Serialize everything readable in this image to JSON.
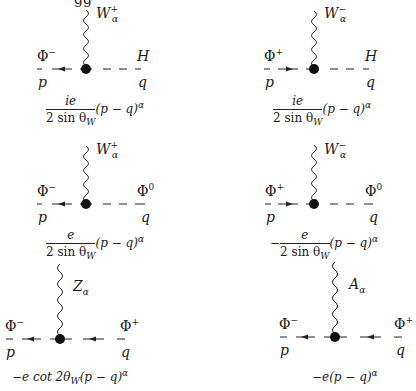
{
  "page": {
    "top_partial_text": "gg"
  },
  "diagrams": [
    {
      "boson": "W",
      "boson_sub": "α",
      "boson_sup": "+",
      "left_field": "Φ",
      "left_sup": "−",
      "left_momentum": "p",
      "right_field": "H",
      "right_sup": "",
      "right_momentum": "q",
      "left_arrow": "left",
      "right_line": "dashed",
      "rule_prefix": "",
      "rule_num": "ie",
      "rule_den": "2 sin θ",
      "rule_den_sub": "W",
      "rule_suffix": "(p − q)",
      "rule_suffix_sup": "α"
    },
    {
      "boson": "W",
      "boson_sub": "α",
      "boson_sup": "−",
      "left_field": "Φ",
      "left_sup": "+",
      "left_momentum": "p",
      "right_field": "H",
      "right_sup": "",
      "right_momentum": "q",
      "left_arrow": "right",
      "right_line": "dashed",
      "rule_prefix": "",
      "rule_num": "ie",
      "rule_den": "2 sin θ",
      "rule_den_sub": "W",
      "rule_suffix": "(p − q)",
      "rule_suffix_sup": "α"
    },
    {
      "boson": "W",
      "boson_sub": "α",
      "boson_sup": "+",
      "left_field": "Φ",
      "left_sup": "−",
      "left_momentum": "p",
      "right_field": "Φ",
      "right_sup": "0",
      "right_momentum": "q",
      "left_arrow": "left",
      "right_line": "dashed",
      "rule_prefix": "",
      "rule_num": "e",
      "rule_den": "2 sin θ",
      "rule_den_sub": "W",
      "rule_suffix": "(p − q)",
      "rule_suffix_sup": "α"
    },
    {
      "boson": "W",
      "boson_sub": "α",
      "boson_sup": "−",
      "left_field": "Φ",
      "left_sup": "+",
      "left_momentum": "p",
      "right_field": "Φ",
      "right_sup": "0",
      "right_momentum": "q",
      "left_arrow": "right",
      "right_line": "dashed",
      "rule_prefix": "−",
      "rule_num": "e",
      "rule_den": "2 sin θ",
      "rule_den_sub": "W",
      "rule_suffix": "(p − q)",
      "rule_suffix_sup": "α"
    },
    {
      "boson": "Z",
      "boson_sub": "α",
      "boson_sup": "",
      "left_field": "Φ",
      "left_sup": "−",
      "left_momentum": "p",
      "right_field": "Φ",
      "right_sup": "+",
      "right_momentum": "q",
      "left_arrow": "left",
      "right_line": "arrow-left",
      "rule_text": "−e cot 2θ",
      "rule_text_sub": "W",
      "rule_suffix": "(p − q)",
      "rule_suffix_sup": "α"
    },
    {
      "boson": "A",
      "boson_sub": "α",
      "boson_sup": "",
      "left_field": "Φ",
      "left_sup": "−",
      "left_momentum": "p",
      "right_field": "Φ",
      "right_sup": "+",
      "right_momentum": "q",
      "left_arrow": "left",
      "right_line": "arrow-left",
      "rule_text": "−e",
      "rule_text_sub": "",
      "rule_suffix": "(p − q)",
      "rule_suffix_sup": "α"
    }
  ]
}
